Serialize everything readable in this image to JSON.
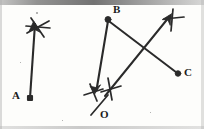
{
  "figure": {
    "background_color": "#fdfdfb",
    "ink_color": "#2a2a2a",
    "width": 204,
    "height": 129,
    "labels": [
      {
        "id": "A",
        "text": "A",
        "x": 12,
        "y": 91,
        "marker": "square-dot",
        "marker_x": 30,
        "marker_y": 98
      },
      {
        "id": "B",
        "text": "B",
        "x": 112,
        "y": 5,
        "marker": "round-dot",
        "marker_x": 108,
        "marker_y": 19
      },
      {
        "id": "C",
        "text": "C",
        "x": 185,
        "y": 68,
        "marker": "round-dot",
        "marker_x": 178,
        "marker_y": 74
      },
      {
        "id": "O",
        "text": "O",
        "x": 100,
        "y": 109,
        "marker": "none",
        "marker_x": 0,
        "marker_y": 0
      }
    ],
    "segments": [
      {
        "name": "ray-A-to-upper-left",
        "from": "A",
        "to": "arrowhead-upper-left",
        "x1": 30,
        "y1": 98,
        "x2": 34,
        "y2": 22,
        "arrow_at_end": true
      },
      {
        "name": "ray-B-to-O",
        "from": "B",
        "to": "arrowhead-near-O",
        "x1": 108,
        "y1": 20,
        "x2": 95,
        "y2": 92,
        "arrow_at_end": true
      },
      {
        "name": "ray-O-to-upper-right",
        "from": "near-O",
        "to": "arrowhead-upper-right",
        "x1": 104,
        "y1": 95,
        "x2": 171,
        "y2": 14,
        "arrow_at_end": true
      },
      {
        "name": "ray-B-to-C",
        "from": "B",
        "to": "C",
        "x1": 110,
        "y1": 21,
        "x2": 177,
        "y2": 73,
        "arrow_at_end": false
      }
    ],
    "tick_marks": [
      {
        "name": "tick-upper-left",
        "x": 38,
        "y": 27,
        "angle": 20,
        "style": "double-cross"
      },
      {
        "name": "tick-upper-right",
        "x": 172,
        "y": 19,
        "angle": 0,
        "style": "single-cross"
      },
      {
        "name": "tick-near-O-left",
        "x": 93,
        "y": 93,
        "angle": 10,
        "style": "single-cross"
      },
      {
        "name": "tick-near-O-right",
        "x": 110,
        "y": 89,
        "angle": 0,
        "style": "single-cross"
      },
      {
        "name": "tick-below-O",
        "x": 100,
        "y": 103,
        "angle": -25,
        "style": "slash"
      }
    ],
    "intersections": [
      {
        "name": "intersection-left",
        "x": 68,
        "y": 58
      },
      {
        "name": "intersection-right",
        "x": 142,
        "y": 55
      }
    ],
    "specks": [
      {
        "x": 36,
        "y": 12,
        "size": 1.5
      },
      {
        "x": 62,
        "y": 120,
        "size": 1
      },
      {
        "x": 150,
        "y": 112,
        "size": 1
      },
      {
        "x": 20,
        "y": 62,
        "size": 1
      }
    ]
  }
}
